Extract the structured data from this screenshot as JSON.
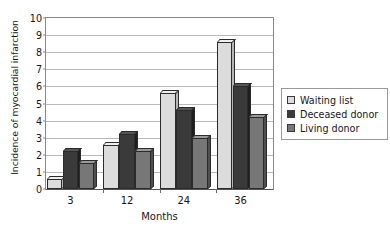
{
  "chart_data": {
    "type": "bar",
    "title": "",
    "subtitle": "",
    "xlabel": "Months",
    "ylabel": "Incidence of myocardial infarction",
    "categories": [
      "3",
      "12",
      "24",
      "36"
    ],
    "series": [
      {
        "name": "Waiting list",
        "color": "#dcdcdc",
        "values": [
          0.6,
          2.6,
          5.6,
          8.6
        ]
      },
      {
        "name": "Deceased donor",
        "color": "#3a3a3a",
        "values": [
          2.2,
          3.2,
          4.6,
          6.0
        ]
      },
      {
        "name": "Living donor",
        "color": "#777777",
        "values": [
          1.5,
          2.2,
          3.0,
          4.2
        ]
      }
    ],
    "ylim": [
      0,
      10
    ],
    "ytick_labels": [
      "0",
      "1",
      "2",
      "3",
      "4",
      "5",
      "6",
      "7",
      "8",
      "9",
      "10"
    ],
    "ytick_values": [
      0,
      1,
      2,
      3,
      4,
      5,
      6,
      7,
      8,
      9,
      10
    ],
    "grid": true,
    "grid_axis": "y",
    "legend_position": "right",
    "style": "3d-bar"
  },
  "legend": {
    "entries": [
      {
        "label": "Waiting list"
      },
      {
        "label": "Deceased donor"
      },
      {
        "label": "Living donor"
      }
    ]
  }
}
